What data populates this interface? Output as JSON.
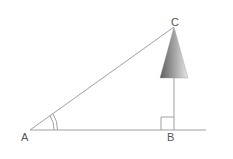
{
  "diagram": {
    "type": "right-triangle-tree-height",
    "points": {
      "A": {
        "label": "A",
        "x": 30,
        "y": 130
      },
      "B": {
        "label": "B",
        "x": 174,
        "y": 130
      },
      "C": {
        "label": "C",
        "x": 174,
        "y": 27
      }
    },
    "baseline": {
      "x1": 30,
      "x2": 206,
      "y": 130
    },
    "tree": {
      "apex_x": 174,
      "apex_y": 27,
      "base_y": 78,
      "base_left": 160,
      "base_right": 188
    },
    "right_angle_at": "B",
    "angle_marked_at": "A",
    "colors": {
      "line": "#888888",
      "tree_dark": "#6a6a6a",
      "tree_light": "#e0e0e0",
      "label": "#555555"
    }
  }
}
